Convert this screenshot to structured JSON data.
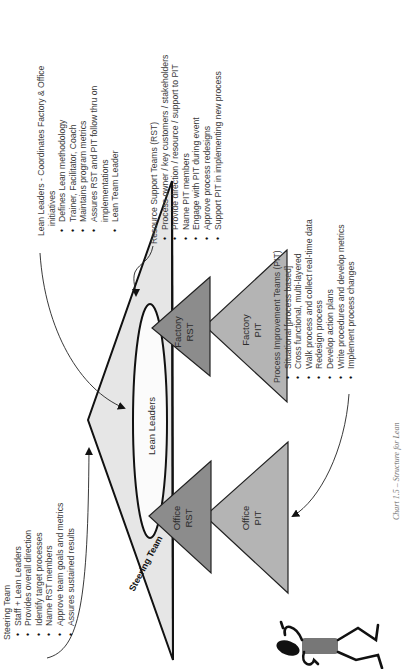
{
  "diagram": {
    "orientation": "rotated 90 degrees counter-clockwise",
    "colors": {
      "steering_fill": "#e6e6e6",
      "rst_fill": "#8c8c8c",
      "pit_fill": "#b4b4b4",
      "outline": "#111111"
    },
    "shapes": {
      "steering_team": "Steering Team",
      "lean_leaders": "Lean Leaders",
      "factory_rst": [
        "Factory",
        "RST"
      ],
      "factory_pit": [
        "Factory",
        "PIT"
      ],
      "office_rst": [
        "Office",
        "RST"
      ],
      "office_pit": [
        "Office",
        "PIT"
      ]
    },
    "lean_leaders_note": {
      "title": "Lean Leaders - Coordinates Factory & Office",
      "title_cont": "initiatives",
      "items": [
        "Defines Lean methodology",
        "Trainer, Facilitator, Coach",
        "Maintains program metrics",
        "Assures RST and PIT follow thru on",
        "Lean Team Leader"
      ],
      "item_4_cont": "implementations"
    },
    "rst_note": {
      "title": "Resource Support Teams (RST)",
      "items": [
        "Process owner / key customers / stakeholders",
        "Provide direction / resource / support to PIT",
        "Name PIT members",
        "Engage with PIT during event",
        "Approve process redesigns",
        "Support PIT in implementing new process"
      ]
    },
    "pit_note": {
      "title": "Process Improvement Teams (PIT)",
      "items": [
        "Situational [process based]",
        "Cross functional, multi-layered",
        "Walk process and collect real-time data",
        "Redesign process",
        "Develop action plans",
        "Write procedures and develop metrics",
        "Implement process changes"
      ]
    },
    "steering_note": {
      "title": "Steering Team",
      "items": [
        "Staff + Lean Leaders",
        "Provides overall direction",
        "Identify target processes",
        "Name RST members",
        "Approve team goals and metrics",
        "Assures sustained results"
      ]
    },
    "caption": "Chart 1.5 – Structure for Lean"
  }
}
